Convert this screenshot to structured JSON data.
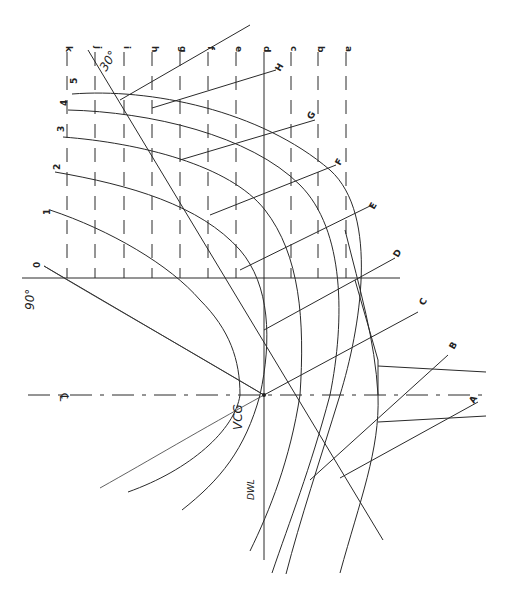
{
  "diagram": {
    "type": "naval architecture cross-curves construction (rotated body plan)",
    "orientation": "rotated 90 degrees",
    "labels": {
      "centerline": "℄",
      "vcg": "VCG",
      "dwl": "DWL",
      "angle_30": "30°",
      "angle_90": "90°"
    },
    "vertical_lines": [
      "k",
      "j",
      "i",
      "h",
      "g",
      "f",
      "e",
      "d",
      "c",
      "b",
      "a"
    ],
    "waterlines": [
      "0",
      "1",
      "2",
      "3",
      "4",
      "5"
    ],
    "stations": [
      "A",
      "B",
      "C",
      "D",
      "E",
      "F",
      "G",
      "H"
    ],
    "colors": {
      "ink": "#2a2a2a",
      "paper": "#ffffff"
    }
  }
}
